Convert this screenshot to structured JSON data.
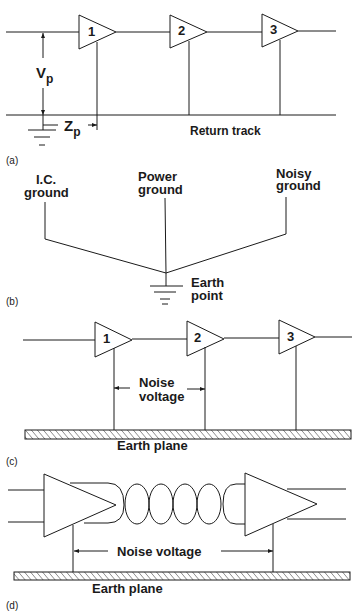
{
  "panels": {
    "a": {
      "caption": "(a)",
      "amplifiers": [
        "1",
        "2",
        "3"
      ],
      "vp_label": "V",
      "vp_sub": "p",
      "zp_label": "Z",
      "zp_sub": "p",
      "return_track": "Return track"
    },
    "b": {
      "caption": "(b)",
      "ic_ground_1": "I.C.",
      "ic_ground_2": "ground",
      "power_ground_1": "Power",
      "power_ground_2": "ground",
      "noisy_ground_1": "Noisy",
      "noisy_ground_2": "ground",
      "earth_point_1": "Earth",
      "earth_point_2": "point"
    },
    "c": {
      "caption": "(c)",
      "amplifiers": [
        "1",
        "2",
        "3"
      ],
      "noise_1": "Noise",
      "noise_2": "voltage",
      "earth_plane": "Earth plane"
    },
    "d": {
      "caption": "(d)",
      "noise_voltage": "Noise voltage",
      "earth_plane": "Earth plane"
    }
  },
  "colors": {
    "ink": "#1a1a1a",
    "background": "#ffffff"
  }
}
